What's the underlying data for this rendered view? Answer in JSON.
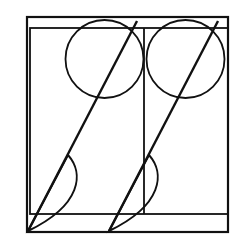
{
  "figure": {
    "title": "geometric-line-drawing",
    "background_color": "#ffffff",
    "stroke_color": "#111111",
    "canvas": {
      "width": 242,
      "height": 243
    },
    "outer_frame": {
      "name": "outer-rectangle",
      "x": 27,
      "y": 17,
      "width": 201,
      "height": 215,
      "stroke_width": 2.2
    },
    "inner_frame": {
      "name": "inner-rectangle",
      "x": 30,
      "y": 28,
      "width": 198,
      "height": 186,
      "stroke_width": 1.8
    },
    "inner_divider": {
      "name": "inner-vertical-divider",
      "x": 144,
      "y_top": 28,
      "y_bottom": 214,
      "stroke_width": 1.8
    },
    "circles": [
      {
        "name": "circle-left",
        "cx": 104.5,
        "cy": 59,
        "r": 39,
        "stroke_width": 1.8
      },
      {
        "name": "circle-right",
        "cx": 185.5,
        "cy": 59,
        "r": 39,
        "stroke_width": 1.8
      }
    ],
    "diagonals": [
      {
        "name": "diagonal-left",
        "x1": 28,
        "y1": 231,
        "x2": 137,
        "y2": 21,
        "stroke_width": 2.4
      },
      {
        "name": "diagonal-right",
        "x1": 109,
        "y1": 231,
        "x2": 218,
        "y2": 21,
        "stroke_width": 2.4
      }
    ],
    "petals": [
      {
        "name": "petal-left",
        "tip_x": 28,
        "tip_y": 231,
        "top_x": 68,
        "top_y": 155,
        "bulge_x": 82,
        "bulge_y": 205,
        "stroke_width": 2.0
      },
      {
        "name": "petal-right",
        "tip_x": 109,
        "tip_y": 231,
        "top_x": 149,
        "top_y": 155,
        "bulge_x": 163,
        "bulge_y": 205,
        "stroke_width": 2.0
      }
    ],
    "counts": {
      "rectangles": 2,
      "circles": 2,
      "diagonals": 2,
      "petals": 2
    }
  }
}
